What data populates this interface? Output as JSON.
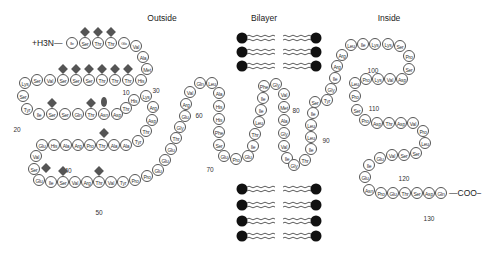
{
  "regions": {
    "outside": "Outside",
    "bilayer": "Bilayer",
    "inside": "Inside"
  },
  "n_terminus": "+H3N—",
  "c_terminus": "—COO−",
  "residues": [
    {
      "aa": "Ile/Leu",
      "x": 72,
      "y": 43
    },
    {
      "aa": "Ser",
      "x": 85,
      "y": 43
    },
    {
      "aa": "Thr",
      "x": 98,
      "y": 43
    },
    {
      "aa": "Thr",
      "x": 111,
      "y": 43
    },
    {
      "aa": "Glx",
      "x": 124,
      "y": 43
    },
    {
      "aa": "Val",
      "x": 136,
      "y": 46
    },
    {
      "aa": "Ala",
      "x": 143,
      "y": 57
    },
    {
      "aa": "Met",
      "x": 147,
      "y": 69
    },
    {
      "aa": "His",
      "x": 141,
      "y": 80
    },
    {
      "aa": "Thr",
      "x": 128,
      "y": 80
    },
    {
      "aa": "Thr",
      "x": 115,
      "y": 80
    },
    {
      "aa": "Thr",
      "x": 102,
      "y": 80
    },
    {
      "aa": "Ser",
      "x": 89,
      "y": 80
    },
    {
      "aa": "Ser",
      "x": 76,
      "y": 80
    },
    {
      "aa": "Ser",
      "x": 63,
      "y": 80
    },
    {
      "aa": "Val",
      "x": 50,
      "y": 80
    },
    {
      "aa": "Ser",
      "x": 37,
      "y": 80
    },
    {
      "aa": "Lys",
      "x": 25,
      "y": 83
    },
    {
      "aa": "Ser",
      "x": 23,
      "y": 96
    },
    {
      "aa": "Tyr",
      "x": 27,
      "y": 109
    },
    {
      "aa": "Ile",
      "x": 39,
      "y": 114
    },
    {
      "aa": "Ser",
      "x": 52,
      "y": 114
    },
    {
      "aa": "Ser",
      "x": 65,
      "y": 114
    },
    {
      "aa": "Gln",
      "x": 78,
      "y": 114
    },
    {
      "aa": "Thr",
      "x": 91,
      "y": 114
    },
    {
      "aa": "Asn",
      "x": 104,
      "y": 114
    },
    {
      "aa": "Asp",
      "x": 117,
      "y": 114
    },
    {
      "aa": "Thr",
      "x": 126,
      "y": 108
    },
    {
      "aa": "His",
      "x": 134,
      "y": 100
    },
    {
      "aa": "Lys",
      "x": 146,
      "y": 96
    },
    {
      "aa": "Arg",
      "x": 153,
      "y": 107
    },
    {
      "aa": "Asp",
      "x": 152,
      "y": 120
    },
    {
      "aa": "Thr",
      "x": 146,
      "y": 131
    },
    {
      "aa": "Tyr",
      "x": 138,
      "y": 141
    },
    {
      "aa": "Ala",
      "x": 126,
      "y": 145
    },
    {
      "aa": "Ala",
      "x": 114,
      "y": 145
    },
    {
      "aa": "Thr",
      "x": 102,
      "y": 145
    },
    {
      "aa": "Pro",
      "x": 90,
      "y": 145
    },
    {
      "aa": "Arg",
      "x": 78,
      "y": 145
    },
    {
      "aa": "Ala",
      "x": 66,
      "y": 145
    },
    {
      "aa": "His",
      "x": 54,
      "y": 145
    },
    {
      "aa": "Glu",
      "x": 42,
      "y": 145
    },
    {
      "aa": "Val",
      "x": 36,
      "y": 156
    },
    {
      "aa": "Ser",
      "x": 34,
      "y": 169
    },
    {
      "aa": "Glu",
      "x": 39,
      "y": 180
    },
    {
      "aa": "Ile",
      "x": 51,
      "y": 182
    },
    {
      "aa": "Ser",
      "x": 63,
      "y": 182
    },
    {
      "aa": "Val",
      "x": 75,
      "y": 182
    },
    {
      "aa": "Arg",
      "x": 87,
      "y": 182
    },
    {
      "aa": "Thr",
      "x": 99,
      "y": 182
    },
    {
      "aa": "Val",
      "x": 111,
      "y": 182
    },
    {
      "aa": "Tyr",
      "x": 123,
      "y": 182
    },
    {
      "aa": "Pro",
      "x": 135,
      "y": 180
    },
    {
      "aa": "Pro",
      "x": 147,
      "y": 176
    },
    {
      "aa": "Glu",
      "x": 158,
      "y": 170
    },
    {
      "aa": "Glu",
      "x": 165,
      "y": 160
    },
    {
      "aa": "Glu",
      "x": 171,
      "y": 149
    },
    {
      "aa": "Thr",
      "x": 176,
      "y": 138
    },
    {
      "aa": "Gly",
      "x": 180,
      "y": 127
    },
    {
      "aa": "Glu",
      "x": 185,
      "y": 116
    },
    {
      "aa": "Arg",
      "x": 186,
      "y": 104
    },
    {
      "aa": "Val",
      "x": 190,
      "y": 92
    },
    {
      "aa": "Gln",
      "x": 200,
      "y": 83
    },
    {
      "aa": "Leu",
      "x": 212,
      "y": 83
    },
    {
      "aa": "Ala",
      "x": 219,
      "y": 93
    },
    {
      "aa": "His",
      "x": 219,
      "y": 106
    },
    {
      "aa": "His",
      "x": 219,
      "y": 119
    },
    {
      "aa": "Phe",
      "x": 219,
      "y": 132
    },
    {
      "aa": "Ser",
      "x": 219,
      "y": 145
    },
    {
      "aa": "Glu",
      "x": 224,
      "y": 156
    },
    {
      "aa": "Pro",
      "x": 236,
      "y": 159
    },
    {
      "aa": "Glu",
      "x": 248,
      "y": 156
    },
    {
      "aa": "Ile",
      "x": 253,
      "y": 146
    },
    {
      "aa": "Thr",
      "x": 255,
      "y": 134
    },
    {
      "aa": "Leu",
      "x": 259,
      "y": 122
    },
    {
      "aa": "Ile",
      "x": 261,
      "y": 110
    },
    {
      "aa": "Ile",
      "x": 263,
      "y": 98
    },
    {
      "aa": "Phe",
      "x": 264,
      "y": 86
    },
    {
      "aa": "Gly",
      "x": 276,
      "y": 84
    },
    {
      "aa": "Val",
      "x": 284,
      "y": 94
    },
    {
      "aa": "Met",
      "x": 284,
      "y": 107
    },
    {
      "aa": "Ala",
      "x": 284,
      "y": 120
    },
    {
      "aa": "Gly",
      "x": 284,
      "y": 133
    },
    {
      "aa": "Val",
      "x": 284,
      "y": 146
    },
    {
      "aa": "Ile",
      "x": 287,
      "y": 158
    },
    {
      "aa": "Gly",
      "x": 294,
      "y": 165
    },
    {
      "aa": "Thr",
      "x": 305,
      "y": 160
    },
    {
      "aa": "Ile",
      "x": 311,
      "y": 149
    },
    {
      "aa": "Leu",
      "x": 311,
      "y": 137
    },
    {
      "aa": "Leu",
      "x": 311,
      "y": 125
    },
    {
      "aa": "Ile",
      "x": 313,
      "y": 113
    },
    {
      "aa": "Ser",
      "x": 315,
      "y": 102
    },
    {
      "aa": "Tyr",
      "x": 327,
      "y": 100
    },
    {
      "aa": "Gly",
      "x": 331,
      "y": 89
    },
    {
      "aa": "Ile",
      "x": 335,
      "y": 78
    },
    {
      "aa": "Arg",
      "x": 337,
      "y": 66
    },
    {
      "aa": "Arg",
      "x": 342,
      "y": 55
    },
    {
      "aa": "Leu",
      "x": 351,
      "y": 45
    },
    {
      "aa": "Ile",
      "x": 363,
      "y": 44
    },
    {
      "aa": "Lys",
      "x": 375,
      "y": 44
    },
    {
      "aa": "Lys",
      "x": 388,
      "y": 44
    },
    {
      "aa": "Ser",
      "x": 400,
      "y": 46
    },
    {
      "aa": "Pro",
      "x": 409,
      "y": 56
    },
    {
      "aa": "Ser",
      "x": 409,
      "y": 69
    },
    {
      "aa": "Asp",
      "x": 402,
      "y": 79
    },
    {
      "aa": "Val",
      "x": 390,
      "y": 79
    },
    {
      "aa": "Lys",
      "x": 378,
      "y": 79
    },
    {
      "aa": "Pro",
      "x": 366,
      "y": 79
    },
    {
      "aa": "Leu",
      "x": 355,
      "y": 83
    },
    {
      "aa": "Pro",
      "x": 355,
      "y": 96
    },
    {
      "aa": "Ser",
      "x": 357,
      "y": 110
    },
    {
      "aa": "Pro",
      "x": 365,
      "y": 120
    },
    {
      "aa": "Asp",
      "x": 377,
      "y": 123
    },
    {
      "aa": "Thr",
      "x": 389,
      "y": 123
    },
    {
      "aa": "Asp",
      "x": 401,
      "y": 123
    },
    {
      "aa": "Val",
      "x": 413,
      "y": 123
    },
    {
      "aa": "Pro",
      "x": 423,
      "y": 131
    },
    {
      "aa": "Leu",
      "x": 425,
      "y": 143
    },
    {
      "aa": "Ser",
      "x": 416,
      "y": 153
    },
    {
      "aa": "Ser",
      "x": 404,
      "y": 155
    },
    {
      "aa": "Val",
      "x": 392,
      "y": 155
    },
    {
      "aa": "Glu",
      "x": 380,
      "y": 158
    },
    {
      "aa": "Ile",
      "x": 369,
      "y": 165
    },
    {
      "aa": "Glu",
      "x": 365,
      "y": 177
    },
    {
      "aa": "Asn",
      "x": 369,
      "y": 190
    },
    {
      "aa": "Pro",
      "x": 381,
      "y": 193
    },
    {
      "aa": "Glu",
      "x": 393,
      "y": 193
    },
    {
      "aa": "Thr",
      "x": 405,
      "y": 193
    },
    {
      "aa": "Ser",
      "x": 417,
      "y": 193
    },
    {
      "aa": "Asp",
      "x": 429,
      "y": 193
    },
    {
      "aa": "Gln",
      "x": 441,
      "y": 193
    }
  ],
  "numbers": [
    {
      "n": "10",
      "x": 126,
      "y": 92
    },
    {
      "n": "20",
      "x": 17,
      "y": 129
    },
    {
      "n": "30",
      "x": 156,
      "y": 90
    },
    {
      "n": "40",
      "x": 68,
      "y": 170
    },
    {
      "n": "50",
      "x": 99,
      "y": 212
    },
    {
      "n": "60",
      "x": 199,
      "y": 115
    },
    {
      "n": "70",
      "x": 210,
      "y": 169
    },
    {
      "n": "80",
      "x": 296,
      "y": 110
    },
    {
      "n": "90",
      "x": 326,
      "y": 140
    },
    {
      "n": "100",
      "x": 373,
      "y": 70
    },
    {
      "n": "110",
      "x": 374,
      "y": 108
    },
    {
      "n": "120",
      "x": 404,
      "y": 178
    },
    {
      "n": "130",
      "x": 429,
      "y": 218
    }
  ],
  "glycosylation_diamonds": [
    {
      "x": 85,
      "y": 32
    },
    {
      "x": 98,
      "y": 32
    },
    {
      "x": 111,
      "y": 32
    },
    {
      "x": 63,
      "y": 69
    },
    {
      "x": 76,
      "y": 69
    },
    {
      "x": 89,
      "y": 69
    },
    {
      "x": 102,
      "y": 69
    },
    {
      "x": 115,
      "y": 69
    },
    {
      "x": 128,
      "y": 69
    },
    {
      "x": 52,
      "y": 103
    },
    {
      "x": 91,
      "y": 103
    },
    {
      "x": 104,
      "y": 133
    },
    {
      "x": 46,
      "y": 168
    },
    {
      "x": 63,
      "y": 171
    },
    {
      "x": 99,
      "y": 171
    }
  ],
  "glycosylation_ovals": [
    {
      "x": 104,
      "y": 102
    }
  ],
  "bilayer": {
    "top_rows": [
      38,
      52,
      66
    ],
    "bottom_rows": [
      189,
      205,
      221,
      236
    ],
    "left_head_x": 242,
    "right_head_x": 316
  }
}
